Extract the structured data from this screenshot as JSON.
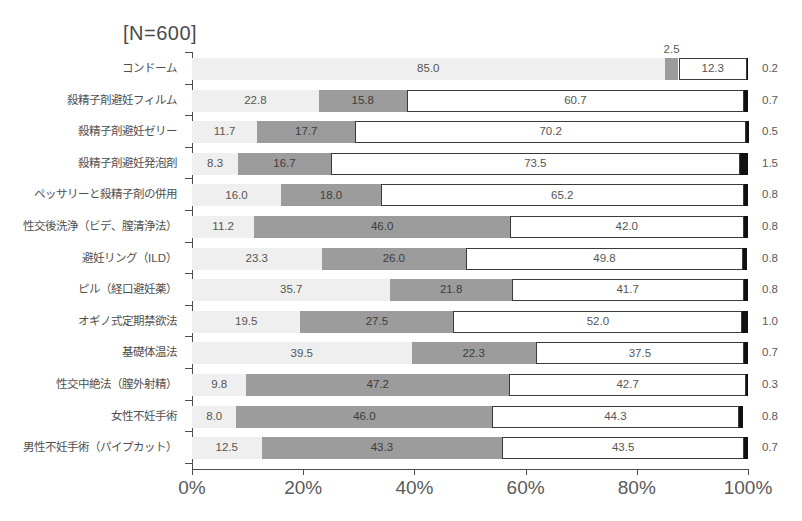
{
  "chart_title": "[N=600]",
  "chart_data": {
    "type": "bar",
    "subtype": "stacked-horizontal-100",
    "title": "[N=600]",
    "xlabel": "",
    "ylabel": "",
    "xlim": [
      0,
      100
    ],
    "grid": false,
    "legend": null,
    "xticks": [
      "0%",
      "20%",
      "40%",
      "60%",
      "80%",
      "100%"
    ],
    "xtick_values": [
      0,
      20,
      40,
      60,
      80,
      100
    ],
    "categories": [
      "コンドーム",
      "殺精子剤避妊フィルム",
      "殺精子剤避妊ゼリー",
      "殺精子剤避妊発泡剤",
      "ペッサリーと殺精子剤の併用",
      "性交後洗浄（ビデ、膣清浄法）",
      "避妊リング（ILD）",
      "ピル（経口避妊薬）",
      "オギノ式定期禁欲法",
      "基礎体温法",
      "性交中絶法（膣外射精）",
      "女性不妊手術",
      "男性不妊手術（パイプカット）"
    ],
    "series": [
      {
        "name": "segment-1",
        "color": "#efefef",
        "values": [
          85.0,
          22.8,
          11.7,
          8.3,
          16.0,
          11.2,
          23.3,
          35.7,
          19.5,
          39.5,
          9.8,
          8.0,
          12.5
        ]
      },
      {
        "name": "segment-2",
        "color": "#9c9c9c",
        "values": [
          2.5,
          15.8,
          17.7,
          16.7,
          18.0,
          46.0,
          26.0,
          21.8,
          27.5,
          22.3,
          47.2,
          46.0,
          43.3
        ]
      },
      {
        "name": "segment-3",
        "color": "#ffffff",
        "values": [
          12.3,
          60.7,
          70.2,
          73.5,
          65.2,
          42.0,
          49.8,
          41.7,
          52.0,
          37.5,
          42.7,
          44.3,
          43.5
        ]
      },
      {
        "name": "segment-4",
        "color": "#111111",
        "values": [
          0.2,
          0.7,
          0.5,
          1.5,
          0.8,
          0.8,
          0.8,
          0.8,
          1.0,
          0.7,
          0.3,
          0.8,
          0.7
        ]
      }
    ],
    "value_labels": {
      "segment-1": [
        "85.0",
        "22.8",
        "11.7",
        "8.3",
        "16.0",
        "11.2",
        "23.3",
        "35.7",
        "19.5",
        "39.5",
        "9.8",
        "8.0",
        "12.5"
      ],
      "segment-2": [
        "2.5",
        "15.8",
        "17.7",
        "16.7",
        "18.0",
        "46.0",
        "26.0",
        "21.8",
        "27.5",
        "22.3",
        "47.2",
        "46.0",
        "43.3"
      ],
      "segment-3": [
        "12.3",
        "60.7",
        "70.2",
        "73.5",
        "65.2",
        "42.0",
        "49.8",
        "41.7",
        "52.0",
        "37.5",
        "42.7",
        "44.3",
        "43.5"
      ],
      "segment-4": [
        "0.2",
        "0.7",
        "0.5",
        "1.5",
        "0.8",
        "0.8",
        "0.8",
        "0.8",
        "1.0",
        "0.7",
        "0.3",
        "0.8",
        "0.7"
      ]
    },
    "annotations": [
      {
        "text": "2.5",
        "row": 0,
        "series": "segment-2",
        "placement": "above-bar"
      }
    ]
  }
}
